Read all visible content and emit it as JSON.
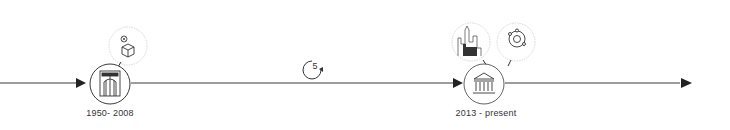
{
  "timeline": {
    "colors": {
      "line": "#3a3a3a",
      "bubble_border": "#d8d8d8",
      "icon": "#333333"
    },
    "nodes": [
      {
        "id": "node-1",
        "label": "1950- 2008",
        "icon": "ship-in-drydock-icon",
        "bubbles": [
          {
            "icon": "cube-with-close-icon"
          }
        ]
      },
      {
        "id": "node-2",
        "label": "2013 - present",
        "icon": "institution-building-icon",
        "bubbles": [
          {
            "icon": "factory-city-icon"
          },
          {
            "icon": "orbit-icon"
          }
        ]
      }
    ],
    "cycle_marker": {
      "value": "5",
      "icon": "refresh-cycle-icon"
    }
  }
}
